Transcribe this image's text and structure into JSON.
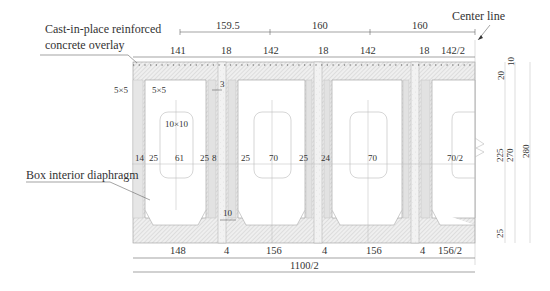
{
  "labels": {
    "overlay": [
      "Cast-in-place reinforced",
      "concrete overlay"
    ],
    "center_line": "Center line",
    "diaphragm": "Box interior diaphragm"
  },
  "top_dims_row1": [
    "159.5",
    "160",
    "160"
  ],
  "top_dims_row2": [
    "141",
    "18",
    "142",
    "18",
    "142",
    "18",
    "142/2"
  ],
  "chamfers": {
    "outer": "5×5",
    "inner": "5×5",
    "hole": "10×10",
    "gap_top": "3",
    "gap_bottom": "10"
  },
  "mid_dims": [
    "14",
    "25",
    "61",
    "25",
    "8",
    "25",
    "70",
    "25",
    "24",
    "70",
    "70/2"
  ],
  "bottom_dims_row1": [
    "148",
    "4",
    "156",
    "4",
    "156",
    "4",
    "156/2"
  ],
  "bottom_dims_row2": [
    "1100/2"
  ],
  "right_dims": {
    "top_overlay": "10",
    "top_slab": "20",
    "inner": "225",
    "web": "270",
    "total": "280",
    "bottom_slab": "25"
  },
  "colors": {
    "line": "#666666",
    "hatch": "#d8d8d8",
    "joint": "#e6e6e6",
    "text": "#333333"
  }
}
